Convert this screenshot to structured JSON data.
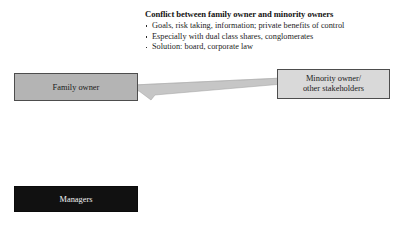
{
  "canvas": {
    "background_color": "#ffffff",
    "width": 405,
    "height": 230
  },
  "text_block": {
    "title": "Conflict between family owner and minority owners",
    "bullets": [
      "Goals, risk taking, information; private benefits of control",
      "Especially with dual class shares, conglomerates",
      "Solution: board, corporate law"
    ]
  },
  "nodes": {
    "family_owner": {
      "label": "Family owner",
      "fill_color": "#b4b4b4",
      "border_color": "#4d4d4d",
      "text_color": "#1b1b1b"
    },
    "minority_owner": {
      "label_line1": "Minority owner/",
      "label_line2": "other stakeholders",
      "fill_color": "#d9d9d9",
      "border_color": "#4d4d4d",
      "text_color": "#1b1b1b"
    },
    "managers": {
      "label": "Managers",
      "fill_color": "#111111",
      "border_color": "#0b0b0b",
      "text_color": "#f2f2f2"
    }
  },
  "connector": {
    "name": "double-arrow-connector",
    "from": "Family owner",
    "to": "Minority owner/other stakeholders",
    "fill_color": "#c6c6c6",
    "stroke_color": "#9a9a9a"
  }
}
